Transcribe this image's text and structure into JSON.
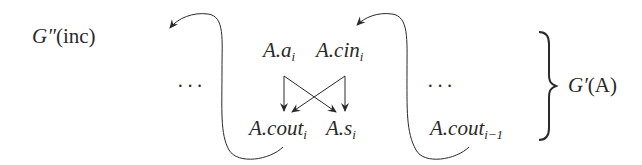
{
  "diagram": {
    "type": "attribute-dependency-graph",
    "colors": {
      "ink": "#2a2a2a",
      "background": "#ffffff"
    },
    "left_label": {
      "base": "G″",
      "arg": "(inc)"
    },
    "right_label": {
      "base": "G′",
      "arg": "(A)",
      "brace": "}"
    },
    "ellipsis_left": "···",
    "ellipsis_right": "···",
    "nodes": {
      "a": {
        "prefix": "A.",
        "name": "a",
        "sub": "i"
      },
      "cin": {
        "prefix": "A.",
        "name": "cin",
        "sub": "i"
      },
      "cout": {
        "prefix": "A.",
        "name": "cout",
        "sub": "i"
      },
      "s": {
        "prefix": "A.",
        "name": "s",
        "sub": "i"
      },
      "cout_prev": {
        "prefix": "A.",
        "name": "cout",
        "sub": "i−1"
      }
    },
    "edges": [
      {
        "from": "A.a_i",
        "to": "A.cout_i"
      },
      {
        "from": "A.a_i",
        "to": "A.s_i"
      },
      {
        "from": "A.cin_i",
        "to": "A.cout_i"
      },
      {
        "from": "A.cin_i",
        "to": "A.s_i"
      },
      {
        "from": "A.cout_i",
        "to": "left (previous stage)",
        "style": "curved"
      },
      {
        "from": "A.cout_(i-1)",
        "to": "A.cin_i",
        "style": "curved"
      }
    ]
  }
}
